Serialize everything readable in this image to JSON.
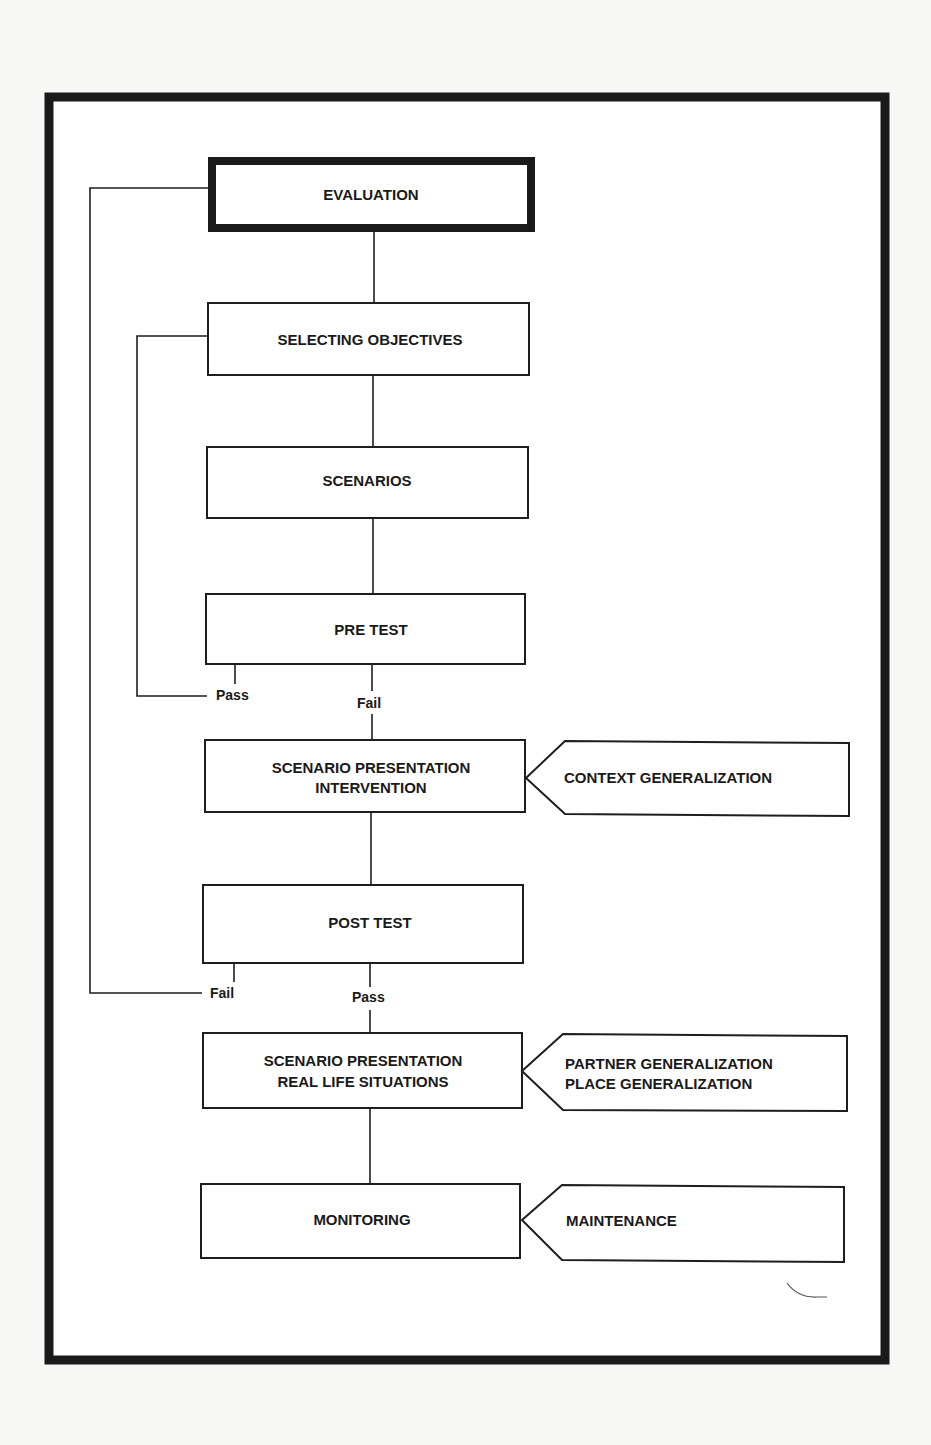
{
  "diagram": {
    "title": "",
    "nodes": {
      "evaluation": {
        "label": "EVALUATION"
      },
      "selecting_objectives": {
        "label": "SELECTING OBJECTIVES"
      },
      "scenarios": {
        "label": "SCENARIOS"
      },
      "pre_test": {
        "label": "PRE TEST"
      },
      "scenario_intervention": {
        "line1": "SCENARIO PRESENTATION",
        "line2": "INTERVENTION"
      },
      "post_test": {
        "label": "POST TEST"
      },
      "scenario_real_life": {
        "line1": "SCENARIO PRESENTATION",
        "line2": "REAL LIFE SITUATIONS"
      },
      "monitoring": {
        "label": "MONITORING"
      }
    },
    "side_nodes": {
      "context_generalization": {
        "label": "CONTEXT GENERALIZATION"
      },
      "partner_place_generalization": {
        "line1": "PARTNER GENERALIZATION",
        "line2": "PLACE GENERALIZATION"
      },
      "maintenance": {
        "label": "MAINTENANCE"
      }
    },
    "branches": {
      "pre_test_pass": "Pass",
      "pre_test_fail": "Fail",
      "post_test_fail": "Fail",
      "post_test_pass": "Pass"
    },
    "edges": [
      {
        "from": "EVALUATION",
        "to": "SELECTING OBJECTIVES"
      },
      {
        "from": "SELECTING OBJECTIVES",
        "to": "SCENARIOS"
      },
      {
        "from": "SCENARIOS",
        "to": "PRE TEST"
      },
      {
        "from": "PRE TEST",
        "to": "SELECTING OBJECTIVES",
        "label": "Pass"
      },
      {
        "from": "PRE TEST",
        "to": "SCENARIO PRESENTATION INTERVENTION",
        "label": "Fail"
      },
      {
        "from": "CONTEXT GENERALIZATION",
        "to": "SCENARIO PRESENTATION INTERVENTION"
      },
      {
        "from": "SCENARIO PRESENTATION INTERVENTION",
        "to": "POST TEST"
      },
      {
        "from": "POST TEST",
        "to": "EVALUATION",
        "label": "Fail"
      },
      {
        "from": "POST TEST",
        "to": "SCENARIO PRESENTATION REAL LIFE SITUATIONS",
        "label": "Pass"
      },
      {
        "from": "PARTNER GENERALIZATION / PLACE GENERALIZATION",
        "to": "SCENARIO PRESENTATION REAL LIFE SITUATIONS"
      },
      {
        "from": "SCENARIO PRESENTATION REAL LIFE SITUATIONS",
        "to": "MONITORING"
      },
      {
        "from": "MAINTENANCE",
        "to": "MONITORING"
      }
    ]
  }
}
